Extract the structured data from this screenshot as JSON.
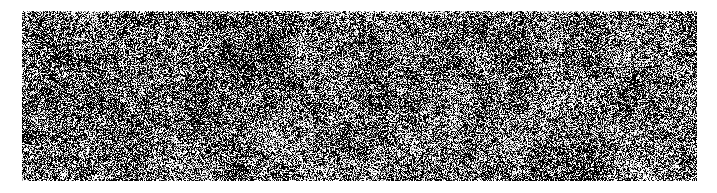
{
  "page": {
    "width": 717,
    "height": 193,
    "background_color": "#ffffff"
  },
  "texture": {
    "name": "binary-noise-texture",
    "description": "High-contrast black and white random grain texture",
    "x": 22,
    "y": 11,
    "width": 675,
    "height": 170,
    "foreground_color": "#000000",
    "background_color": "#ffffff",
    "mid_tone_color": "#808080",
    "pattern_type": "salt-and-pepper",
    "grain_scale_px": 1,
    "clump_scale_px": 4,
    "density_percent": 52,
    "contrast": "high",
    "seed": 20240517,
    "edge_fade_top_px": 3,
    "label": ""
  }
}
